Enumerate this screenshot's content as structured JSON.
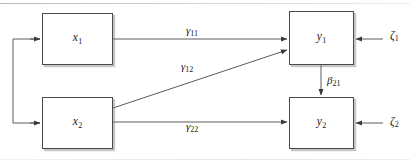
{
  "figure": {
    "kind": "path-diagram",
    "background_color": "#ffffff",
    "line_color": "#4a4a4a",
    "text_color": "#1a1a1a"
  },
  "nodes": [
    {
      "id": "x1",
      "symbol": "x",
      "subscript": "1",
      "x": 42,
      "y": 13,
      "w": 71,
      "h": 52
    },
    {
      "id": "x2",
      "symbol": "x",
      "subscript": "2",
      "x": 42,
      "y": 97,
      "w": 71,
      "h": 52
    },
    {
      "id": "y1",
      "symbol": "y",
      "subscript": "1",
      "x": 289,
      "y": 11,
      "w": 65,
      "h": 54
    },
    {
      "id": "y2",
      "symbol": "y",
      "subscript": "2",
      "x": 289,
      "y": 97,
      "w": 65,
      "h": 52
    }
  ],
  "paths": [
    {
      "id": "gamma11",
      "glyph": "γ",
      "subscript": "11",
      "from": "x1",
      "to": "y1",
      "label_x": 186,
      "label_y": 25
    },
    {
      "id": "gamma12",
      "glyph": "γ",
      "subscript": "12",
      "from": "x2",
      "to": "y1",
      "label_x": 181,
      "label_y": 61
    },
    {
      "id": "gamma22",
      "glyph": "γ",
      "subscript": "22",
      "from": "x2",
      "to": "y2",
      "label_x": 186,
      "label_y": 121
    },
    {
      "id": "beta21",
      "glyph": "β",
      "subscript": "21",
      "from": "y1",
      "to": "y2",
      "label_x": 327,
      "label_y": 75
    }
  ],
  "disturbances": [
    {
      "id": "zeta1",
      "glyph": "ζ",
      "subscript": "1",
      "target": "y1",
      "label_x": 390,
      "label_y": 30
    },
    {
      "id": "zeta2",
      "glyph": "ζ",
      "subscript": "2",
      "target": "y2",
      "label_x": 390,
      "label_y": 116
    }
  ],
  "covariance": {
    "id": "x1-x2-covariance",
    "from": "x1",
    "to": "x2",
    "style": "double-headed-bracket-left"
  }
}
